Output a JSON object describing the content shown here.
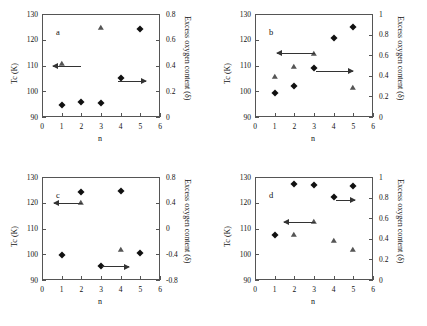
{
  "figure": {
    "xlabel": "n",
    "ylabel_left": "T_c (K)",
    "ylabel_right": "Excess oxygen content (δ)",
    "x_ticks": [
      "0",
      "1",
      "2",
      "3",
      "4",
      "5",
      "6"
    ],
    "y_left_ticks": [
      "90",
      "100",
      "110",
      "120",
      "130"
    ],
    "marker_left": "diamond",
    "marker_right": "triangle"
  },
  "chart_data": [
    {
      "type": "scatter",
      "panel": "a",
      "title": "a",
      "xlabel": "n",
      "ylabel": "T_c (K)",
      "ylabel_right": "Excess oxygen content (δ)",
      "xlim": [
        0,
        6
      ],
      "ylim": [
        90,
        130
      ],
      "ylim_right": [
        0,
        0.8
      ],
      "y_right_ticks": [
        "0",
        "0.2",
        "0.4",
        "0.6",
        "0.8"
      ],
      "grid": false,
      "legend": "none",
      "series": [
        {
          "name": "T_c (K)",
          "marker": "diamond",
          "axis": "left",
          "x": [
            1,
            2,
            3,
            4,
            5
          ],
          "values": [
            94.5,
            96.0,
            95.5,
            105.2,
            124.3
          ]
        },
        {
          "name": "Excess oxygen content (δ)",
          "marker": "triangle",
          "axis": "right",
          "x": [
            1,
            3
          ],
          "values": [
            0.41,
            0.69
          ]
        }
      ],
      "annotations": [
        {
          "type": "arrow",
          "direction": "left",
          "x_from": 2.0,
          "x_to": 0.55,
          "y": 110
        },
        {
          "type": "arrow",
          "direction": "right",
          "x_from": 3.85,
          "x_to": 5.3,
          "y": 104
        }
      ]
    },
    {
      "type": "scatter",
      "panel": "b",
      "title": "b",
      "xlabel": "n",
      "ylabel": "T_c (K)",
      "ylabel_right": "Excess oxygen content (δ)",
      "xlim": [
        0,
        6
      ],
      "ylim": [
        90,
        130
      ],
      "ylim_right": [
        0,
        1
      ],
      "y_right_ticks": [
        "0",
        "0.2",
        "0.4",
        "0.6",
        "0.8",
        "1"
      ],
      "grid": false,
      "legend": "none",
      "series": [
        {
          "name": "T_c (K)",
          "marker": "diamond",
          "axis": "left",
          "x": [
            1,
            2,
            3,
            4,
            5
          ],
          "values": [
            99.3,
            101.9,
            108.9,
            120.6,
            125.0
          ]
        },
        {
          "name": "Excess oxygen content (δ)",
          "marker": "triangle",
          "axis": "right",
          "x": [
            1,
            2,
            3,
            5
          ],
          "values": [
            0.39,
            0.49,
            0.61,
            0.28
          ]
        }
      ],
      "annotations": [
        {
          "type": "arrow",
          "direction": "left",
          "x_from": 3.05,
          "x_to": 1.1,
          "y": 115
        },
        {
          "type": "arrow",
          "direction": "right",
          "x_from": 3.1,
          "x_to": 5.0,
          "y": 108
        }
      ]
    },
    {
      "type": "scatter",
      "panel": "c",
      "title": "c",
      "xlabel": "n",
      "ylabel": "T_c (K)",
      "ylabel_right": "Excess oxygen content (δ)",
      "xlim": [
        0,
        6
      ],
      "ylim": [
        90,
        130
      ],
      "ylim_right": [
        -0.8,
        0.8
      ],
      "y_right_ticks": [
        "-0.8",
        "-0.4",
        "0",
        "0.4",
        "0.8"
      ],
      "grid": false,
      "legend": "none",
      "series": [
        {
          "name": "T_c (K)",
          "marker": "diamond",
          "axis": "left",
          "x": [
            1,
            2,
            3,
            4,
            5
          ],
          "values": [
            99.6,
            124.2,
            95.3,
            124.6,
            100.4
          ]
        },
        {
          "name": "Excess oxygen content (δ)",
          "marker": "triangle",
          "axis": "right",
          "x": [
            2,
            4
          ],
          "values": [
            0.39,
            -0.33
          ]
        }
      ],
      "annotations": [
        {
          "type": "arrow",
          "direction": "left",
          "x_from": 2.05,
          "x_to": 0.6,
          "y": 120
        },
        {
          "type": "arrow",
          "direction": "right",
          "x_from": 3.05,
          "x_to": 4.4,
          "y": 95.3
        }
      ]
    },
    {
      "type": "scatter",
      "panel": "d",
      "title": "d",
      "xlabel": "n",
      "ylabel": "T_c (K)",
      "ylabel_right": "Excess oxygen content (δ)",
      "xlim": [
        0,
        6
      ],
      "ylim": [
        90,
        130
      ],
      "ylim_right": [
        0,
        1
      ],
      "y_right_ticks": [
        "0",
        "0.2",
        "0.4",
        "0.6",
        "0.8",
        "1"
      ],
      "grid": false,
      "legend": "none",
      "series": [
        {
          "name": "T_c (K)",
          "marker": "diamond",
          "axis": "left",
          "x": [
            1,
            2,
            3,
            4,
            5
          ],
          "values": [
            107.6,
            127.2,
            126.8,
            122.4,
            126.6
          ]
        },
        {
          "name": "Excess oxygen content (δ)",
          "marker": "triangle",
          "axis": "right",
          "x": [
            2,
            3,
            4,
            5
          ],
          "values": [
            0.44,
            0.56,
            0.38,
            0.29
          ]
        }
      ],
      "annotations": [
        {
          "type": "arrow",
          "direction": "left",
          "x_from": 3.05,
          "x_to": 1.45,
          "y": 112.6
        },
        {
          "type": "arrow",
          "direction": "right",
          "x_from": 4.1,
          "x_to": 5.1,
          "y": 121.2
        }
      ]
    }
  ]
}
